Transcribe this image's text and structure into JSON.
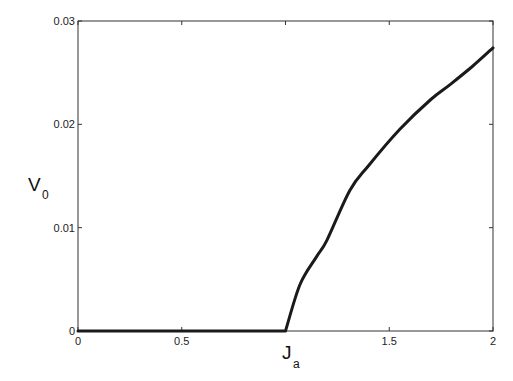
{
  "chart_data": {
    "type": "line",
    "title": "",
    "xlabel": "J_a",
    "xlabel_main": "J",
    "xlabel_sub": "a",
    "ylabel": "V_0",
    "ylabel_main": "V",
    "ylabel_sub": "0",
    "xlim": [
      0,
      2
    ],
    "ylim": [
      0,
      0.03
    ],
    "grid": false,
    "legend": null,
    "x_ticks": [
      0,
      0.5,
      1,
      1.5,
      2
    ],
    "x_tick_labels": [
      "0",
      "0.5",
      "",
      "1.5",
      "2"
    ],
    "y_ticks": [
      0,
      0.01,
      0.02,
      0.03
    ],
    "y_tick_labels": [
      "0",
      "0.01",
      "0.02",
      "0.03"
    ],
    "series": [
      {
        "name": "V_0",
        "color": "#1a1a1a",
        "x": [
          0,
          0.5,
          1.0,
          1.07,
          1.15,
          1.2,
          1.31,
          1.4,
          1.55,
          1.7,
          1.79,
          1.9,
          2.0
        ],
        "y": [
          0,
          0,
          0,
          0.0045,
          0.0072,
          0.0088,
          0.0136,
          0.016,
          0.0195,
          0.0224,
          0.0238,
          0.0256,
          0.0274
        ]
      }
    ]
  }
}
